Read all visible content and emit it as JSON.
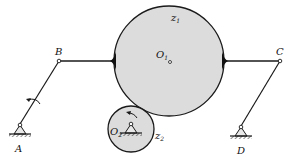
{
  "diagram": {
    "type": "mechanism",
    "colors": {
      "line": "#1a1a1a",
      "gear_fill": "#dcdcdc",
      "background": "#ffffff"
    },
    "labels": {
      "A": "A",
      "B": "B",
      "C": "C",
      "D": "D",
      "O1": "O",
      "O1_sub": "1",
      "O2": "O",
      "O2_sub": "2",
      "z1": "z",
      "z1_sub": "1",
      "z2": "z",
      "z2_sub": "2"
    },
    "joints": {
      "A": {
        "type": "ground pivot"
      },
      "B": {
        "type": "revolute"
      },
      "C": {
        "type": "revolute"
      },
      "D": {
        "type": "ground pivot"
      },
      "O1": {
        "type": "gear center"
      },
      "O2": {
        "type": "ground pivot, gear center"
      }
    },
    "rotation_arrows": [
      "link AB",
      "gear z2"
    ]
  }
}
